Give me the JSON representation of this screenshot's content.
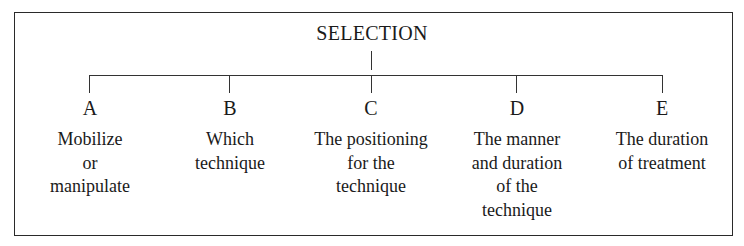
{
  "diagram": {
    "root": {
      "label": "SELECTION"
    },
    "children": [
      {
        "letter": "A",
        "lines": [
          "Mobilize",
          "or",
          "manipulate"
        ]
      },
      {
        "letter": "B",
        "lines": [
          "Which",
          "technique"
        ]
      },
      {
        "letter": "C",
        "lines": [
          "The positioning",
          "for the",
          "technique"
        ]
      },
      {
        "letter": "D",
        "lines": [
          "The manner",
          "and duration",
          "of the",
          "technique"
        ]
      },
      {
        "letter": "E",
        "lines": [
          "The duration",
          "of treatment"
        ]
      }
    ]
  }
}
